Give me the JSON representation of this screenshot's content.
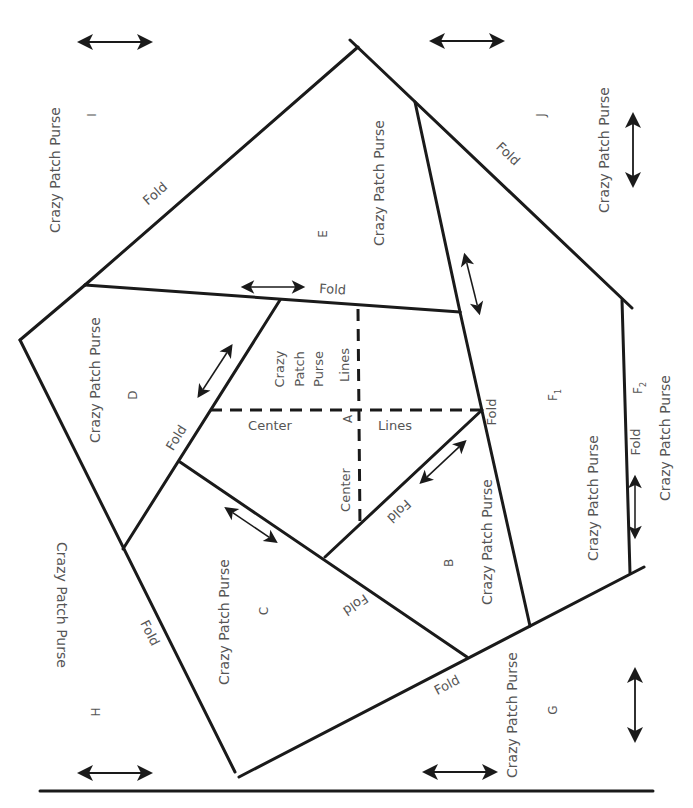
{
  "diagram": {
    "pattern_label": "Crazy Patch Purse",
    "fold_label": "Fold",
    "center_label": "Center",
    "lines_label": "Lines",
    "pieces": {
      "A": "A",
      "B": "B",
      "C": "C",
      "D": "D",
      "E": "E",
      "F1": "F",
      "F1_sub": "1",
      "F2": "F",
      "F2_sub": "2",
      "G": "G",
      "H": "H",
      "I": "I",
      "J": "J"
    },
    "a_label_lines": [
      "Crazy",
      "Patch",
      "Purse"
    ],
    "colors": {
      "line": "#1a1a1a",
      "text": "#555555",
      "background": "#ffffff"
    }
  }
}
